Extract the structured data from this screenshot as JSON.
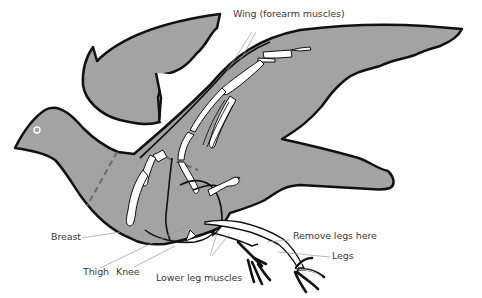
{
  "diagram": {
    "colors": {
      "body_fill": "#a3a3a3",
      "outline": "#111111",
      "bone": "#ffffff",
      "cut_line": "#6e6e6e",
      "leader_line": "#9a9a9a",
      "label_text": "#3a3a3a",
      "background": "#ffffff"
    },
    "labels": {
      "wing": "Wing (forearm muscles)",
      "breast": "Breast",
      "thigh": "Thigh",
      "knee": "Knee",
      "lower_leg_muscles": "Lower leg muscles",
      "remove_legs": "Remove legs here",
      "legs": "Legs"
    }
  }
}
